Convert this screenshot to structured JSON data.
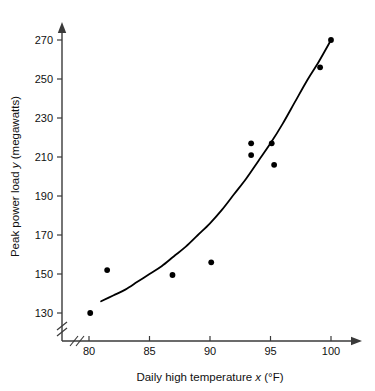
{
  "chart_data": {
    "type": "scatter",
    "title": "",
    "xlabel": "Daily high temperature x (°F)",
    "ylabel": "Peak power load y (megawatts)",
    "xlabel_parts": {
      "prefix": "Daily high temperature ",
      "variable": "x",
      "suffix": " (°F)"
    },
    "ylabel_parts": {
      "prefix": "Peak power load ",
      "variable": "y",
      "suffix": " (megawatts)"
    },
    "xlim": [
      79,
      101
    ],
    "ylim": [
      126,
      276
    ],
    "xticks": [
      80,
      85,
      90,
      95,
      100
    ],
    "xtick_labels": [
      "80",
      "85",
      "90",
      "95",
      "100"
    ],
    "yticks": [
      130,
      150,
      170,
      190,
      210,
      230,
      250,
      270
    ],
    "ytick_labels": [
      "130",
      "150",
      "170",
      "190",
      "210",
      "230",
      "250",
      "270"
    ],
    "grid": false,
    "legend": false,
    "axis_break_x": true,
    "axis_break_y": true,
    "axis_arrows": true,
    "marker_color": "#000000",
    "line_color": "#000000",
    "axis_color": "#3a3a3a",
    "points": [
      {
        "x": 80.1,
        "y": 130
      },
      {
        "x": 81.5,
        "y": 152
      },
      {
        "x": 86.9,
        "y": 149.5
      },
      {
        "x": 90.1,
        "y": 156
      },
      {
        "x": 93.4,
        "y": 217
      },
      {
        "x": 93.4,
        "y": 211
      },
      {
        "x": 95.1,
        "y": 217
      },
      {
        "x": 95.3,
        "y": 206
      },
      {
        "x": 99.1,
        "y": 256
      },
      {
        "x": 100.0,
        "y": 270
      }
    ],
    "fit_curve": {
      "name": "fitted quadratic trend",
      "points": [
        {
          "x": 81.0,
          "y": 136
        },
        {
          "x": 82.0,
          "y": 139
        },
        {
          "x": 83.0,
          "y": 142
        },
        {
          "x": 84.0,
          "y": 146
        },
        {
          "x": 85.0,
          "y": 150
        },
        {
          "x": 86.0,
          "y": 154
        },
        {
          "x": 87.0,
          "y": 159
        },
        {
          "x": 88.0,
          "y": 164
        },
        {
          "x": 89.0,
          "y": 170
        },
        {
          "x": 90.0,
          "y": 176
        },
        {
          "x": 91.0,
          "y": 183
        },
        {
          "x": 92.0,
          "y": 191
        },
        {
          "x": 93.0,
          "y": 199
        },
        {
          "x": 94.0,
          "y": 208
        },
        {
          "x": 95.0,
          "y": 217
        },
        {
          "x": 96.0,
          "y": 227
        },
        {
          "x": 97.0,
          "y": 238
        },
        {
          "x": 98.0,
          "y": 249
        },
        {
          "x": 99.0,
          "y": 259
        },
        {
          "x": 100.0,
          "y": 270
        }
      ]
    }
  }
}
